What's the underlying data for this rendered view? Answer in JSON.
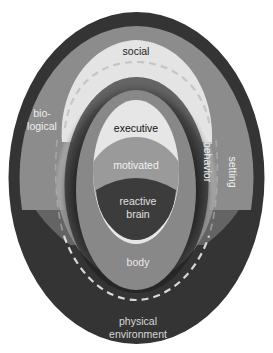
{
  "diagram": {
    "type": "nested-ellipse-layers",
    "labels": {
      "social": "social",
      "biological_line1": "bio-",
      "biological_line2": "logical",
      "executive": "executive",
      "motivated": "motivated",
      "reactive_line1": "reactive",
      "reactive_line2": "brain",
      "behavior": "behavior",
      "setting": "setting",
      "body": "body",
      "physical_line1": "physical",
      "physical_line2": "environment"
    },
    "colors": {
      "physical_environment": "#343434",
      "biological_setting": "#8c8c8c",
      "social": "#e4e4e4",
      "behavior_halo": "#1e1e1e",
      "body": "#888888",
      "executive": "#e6e6e6",
      "motivated": "#9a9a9a",
      "reactive_brain": "#3c3c3c",
      "dashed_line": "#d8d8d8"
    }
  }
}
